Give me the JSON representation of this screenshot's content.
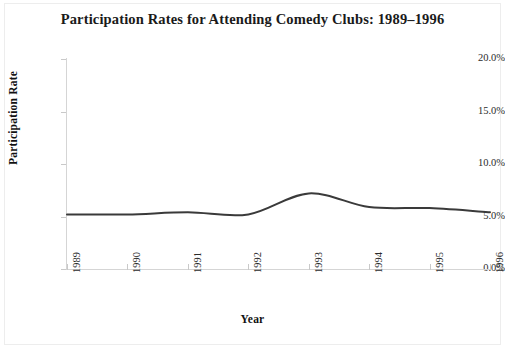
{
  "chart_data": {
    "type": "line",
    "title": "Participation Rates for Attending Comedy Clubs: 1989–1996",
    "xlabel": "Year",
    "ylabel": "Participation Rate",
    "categories": [
      "1989",
      "1990",
      "1991",
      "1992",
      "1993",
      "1994",
      "1995",
      "1996"
    ],
    "x": [
      1989,
      1990,
      1991,
      1992,
      1993,
      1994,
      1995,
      1996
    ],
    "values": [
      5.2,
      5.2,
      5.4,
      5.2,
      7.2,
      5.9,
      5.8,
      5.4
    ],
    "series": [
      {
        "name": "Participation Rate",
        "values": [
          5.2,
          5.2,
          5.4,
          5.2,
          7.2,
          5.9,
          5.8,
          5.4
        ]
      }
    ],
    "ylim": [
      0.0,
      20.0
    ],
    "ytick_values": [
      0.0,
      5.0,
      10.0,
      15.0,
      20.0
    ],
    "ytick_labels": [
      "0.0%",
      "5.0%",
      "10.0%",
      "15.0%",
      "20.0%"
    ],
    "xtick_labels": [
      "1989",
      "1990",
      "1991",
      "1992",
      "1993",
      "1994",
      "1995",
      "1996"
    ],
    "grid": false,
    "legend": false,
    "legend_position": "none",
    "line_color": "#3a3a3a",
    "axis_color": "#d5d5d5",
    "background_color": "#ffffff",
    "smoothing": "spline"
  },
  "figure": {
    "frame_border_color": "#ededed"
  }
}
